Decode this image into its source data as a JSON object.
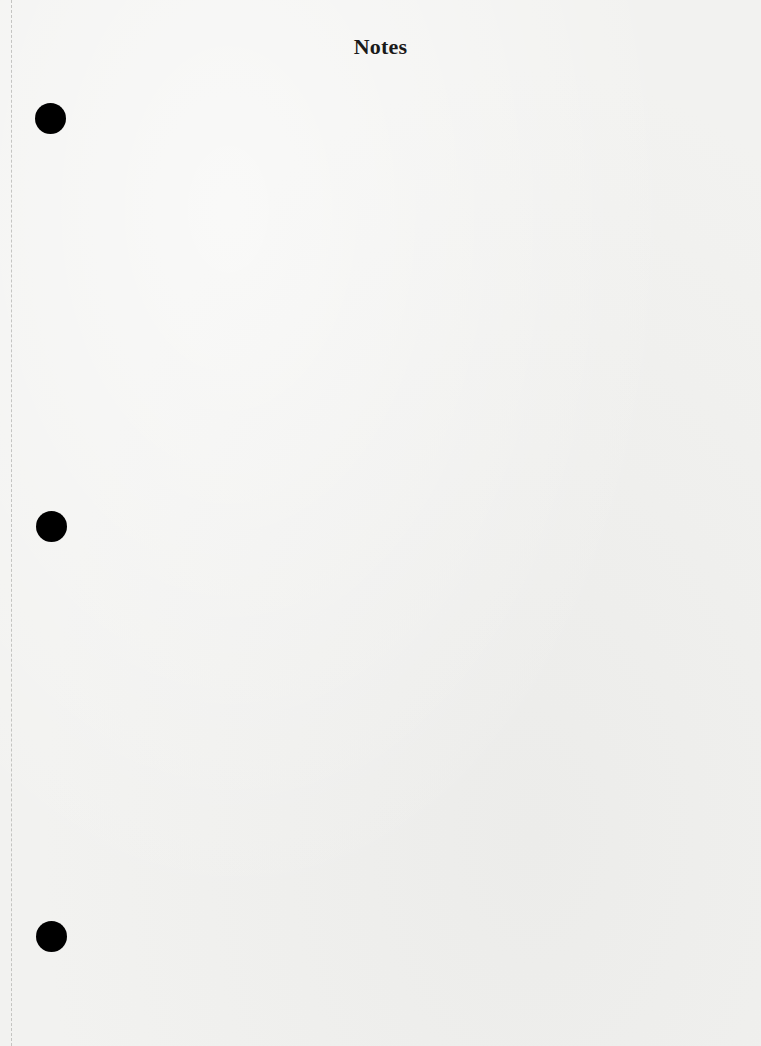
{
  "page": {
    "title": "Notes",
    "background_color": "#f2f2f0",
    "hole_color": "#000000",
    "hole_punches": [
      {
        "position": "top"
      },
      {
        "position": "middle"
      },
      {
        "position": "bottom"
      }
    ],
    "body_text": ""
  }
}
